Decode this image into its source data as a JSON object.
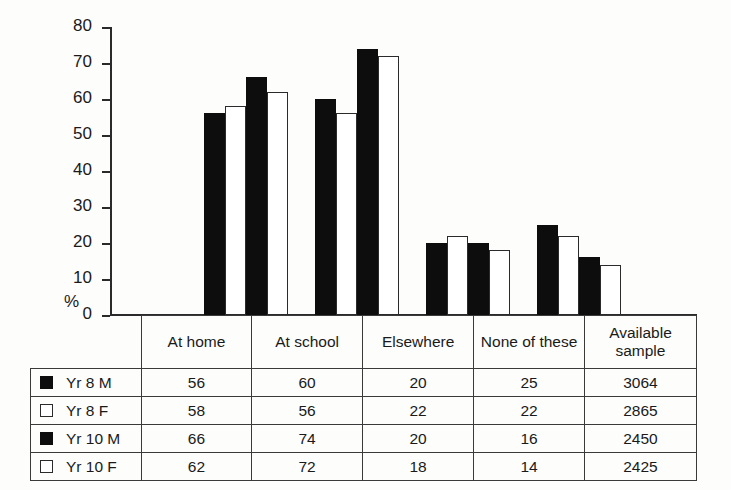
{
  "chart_data": {
    "type": "bar",
    "title": "",
    "subtitle": "",
    "xlabel": "",
    "ylabel": "%",
    "ylim": [
      0,
      80
    ],
    "ytick_step": 10,
    "yticks": [
      80,
      70,
      60,
      50,
      40,
      30,
      20,
      10,
      0
    ],
    "grid": false,
    "legend_position": "table-left-column",
    "categories": [
      "At home",
      "At school",
      "Elsewhere",
      "None of these"
    ],
    "series": [
      {
        "name": "Yr 8 M",
        "fill": "black",
        "values": [
          56,
          60,
          20,
          25
        ],
        "available_sample": 3064
      },
      {
        "name": "Yr 8 F",
        "fill": "white",
        "values": [
          58,
          56,
          22,
          22
        ],
        "available_sample": 2865
      },
      {
        "name": "Yr 10 M",
        "fill": "black",
        "values": [
          66,
          74,
          20,
          16
        ],
        "available_sample": 2450
      },
      {
        "name": "Yr 10 F",
        "fill": "white",
        "values": [
          62,
          72,
          18,
          14
        ],
        "available_sample": 2425
      }
    ]
  },
  "axis": {
    "y_unit_label": "%",
    "tick_labels": [
      "80",
      "70",
      "60",
      "50",
      "40",
      "30",
      "20",
      "10",
      "0"
    ]
  },
  "table": {
    "headers": [
      "At home",
      "At school",
      "Elsewhere",
      "None of these",
      "Available sample"
    ],
    "rows": [
      {
        "legend": "Yr 8 M",
        "swatch": "filled-square",
        "cells": [
          "56",
          "60",
          "20",
          "25",
          "3064"
        ]
      },
      {
        "legend": "Yr 8 F",
        "swatch": "hollow-square",
        "cells": [
          "58",
          "56",
          "22",
          "22",
          "2865"
        ]
      },
      {
        "legend": "Yr 10 M",
        "swatch": "filled-square",
        "cells": [
          "66",
          "74",
          "20",
          "16",
          "2450"
        ]
      },
      {
        "legend": "Yr 10 F",
        "swatch": "hollow-square",
        "cells": [
          "62",
          "72",
          "18",
          "14",
          "2425"
        ]
      }
    ]
  },
  "colors": {
    "bar_filled": "#0d0d0d",
    "bar_hollow": "#ffffff",
    "outline": "#2b2b2b",
    "background": "#fdfdfc"
  }
}
